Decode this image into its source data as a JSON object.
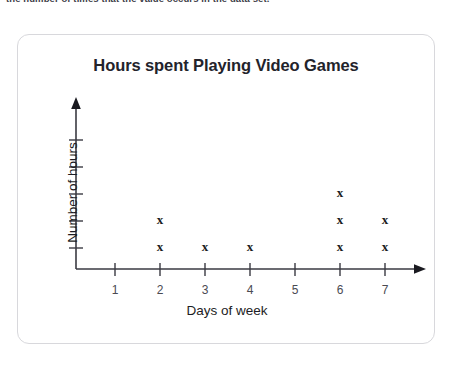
{
  "top_note": "the number of times that the value occurs in the data set.",
  "card": {
    "border_color": "#d8d8dc",
    "background": "#ffffff"
  },
  "chart_data": {
    "type": "scatter",
    "plot_style": "dot-plot-x-marks",
    "title": "Hours spent Playing Video Games",
    "xlabel": "Days of week",
    "ylabel": "Number of hours",
    "categories": [
      "1",
      "2",
      "3",
      "4",
      "5",
      "6",
      "7"
    ],
    "x": [
      1,
      2,
      3,
      4,
      5,
      6,
      7
    ],
    "values": [
      0,
      2,
      1,
      1,
      0,
      3,
      2
    ],
    "marker": "x",
    "marker_color": "#1a1a20",
    "axis_color": "#3a3a42",
    "xlim": [
      0,
      7.8
    ],
    "ylim": [
      0,
      6
    ],
    "y_tick_count": 5,
    "y_tick_labels": [],
    "grid": false,
    "legend": null,
    "axis_arrows": [
      "x-right",
      "y-up"
    ],
    "points": [
      {
        "day": "2",
        "count": 2
      },
      {
        "day": "3",
        "count": 1
      },
      {
        "day": "4",
        "count": 1
      },
      {
        "day": "6",
        "count": 3
      },
      {
        "day": "7",
        "count": 2
      }
    ]
  }
}
